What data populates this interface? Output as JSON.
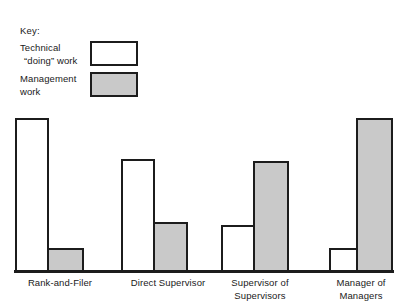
{
  "legend": {
    "title": "Key:",
    "entries": [
      {
        "name": "technical-doing-work",
        "line1": "Technical",
        "line2": "“doing” work",
        "swatch": "white",
        "color": "#ffffff"
      },
      {
        "name": "management-work",
        "line1": "Management",
        "line2": "work",
        "swatch": "gray",
        "color": "#c9c9c9"
      }
    ]
  },
  "chart_data": {
    "type": "bar",
    "title": "",
    "subtitle": "",
    "xlabel": "",
    "ylabel": "",
    "grid": false,
    "legend_position": "top-left",
    "axis_note": "Unlabeled vertical axis; values are proportions of time read off bar heights relative to the tallest bar (=100).",
    "ylim": [
      0,
      100
    ],
    "categories": [
      "Rank-and-Filer",
      "Direct Supervisor",
      "Supervisor of Supervisors",
      "Manager of Managers"
    ],
    "category_lines": [
      [
        "Rank-and-Filer"
      ],
      [
        "Direct Supervisor"
      ],
      [
        "Supervisor of",
        "Supervisors"
      ],
      [
        "Manager of",
        "Managers"
      ]
    ],
    "series": [
      {
        "name": "Technical “doing” work",
        "key": "technical",
        "color": "#ffffff",
        "values": [
          100,
          73,
          31,
          16
        ]
      },
      {
        "name": "Management work",
        "key": "management",
        "color": "#c9c9c9",
        "values": [
          16,
          32,
          72,
          100
        ]
      }
    ],
    "bars": [
      {
        "group": "Rank-and-Filer",
        "series": "Technical “doing” work",
        "value": 100,
        "fill": "white",
        "left": 15,
        "top": 118,
        "width": 34,
        "height": 154
      },
      {
        "group": "Rank-and-Filer",
        "series": "Management work",
        "value": 16,
        "fill": "gray",
        "left": 47,
        "top": 248,
        "width": 37,
        "height": 24
      },
      {
        "group": "Direct Supervisor",
        "series": "Technical “doing” work",
        "value": 73,
        "fill": "white",
        "left": 121,
        "top": 159,
        "width": 34,
        "height": 113
      },
      {
        "group": "Direct Supervisor",
        "series": "Management work",
        "value": 32,
        "fill": "gray",
        "left": 153,
        "top": 222,
        "width": 35,
        "height": 50
      },
      {
        "group": "Supervisor of Supervisors",
        "series": "Technical “doing” work",
        "value": 31,
        "fill": "white",
        "left": 221,
        "top": 225,
        "width": 34,
        "height": 47
      },
      {
        "group": "Supervisor of Supervisors",
        "series": "Management work",
        "value": 72,
        "fill": "gray",
        "left": 253,
        "top": 161,
        "width": 36,
        "height": 111
      },
      {
        "group": "Manager of Managers",
        "series": "Technical “doing” work",
        "value": 16,
        "fill": "white",
        "left": 329,
        "top": 248,
        "width": 29,
        "height": 24
      },
      {
        "group": "Manager of Managers",
        "series": "Management work",
        "value": 100,
        "fill": "gray",
        "left": 356,
        "top": 118,
        "width": 37,
        "height": 154
      }
    ],
    "group_label_positions": [
      {
        "left": 10,
        "width": 100
      },
      {
        "left": 112,
        "width": 112
      },
      {
        "left": 208,
        "width": 104
      },
      {
        "left": 318,
        "width": 86
      }
    ]
  }
}
